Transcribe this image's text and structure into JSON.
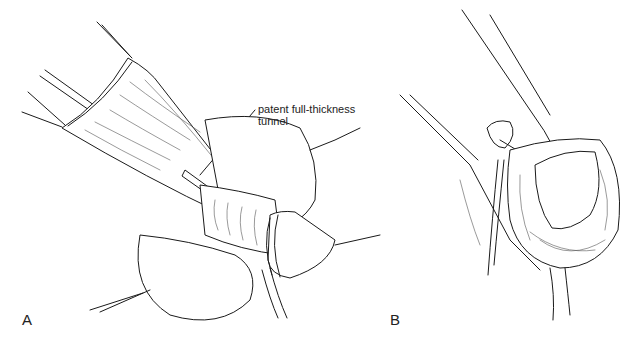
{
  "figure": {
    "panels": [
      {
        "id": "A",
        "label": "A",
        "callouts": [
          {
            "text_line1": "patent full-thickness",
            "text_line2": "tunnel"
          }
        ]
      },
      {
        "id": "B",
        "label": "B"
      }
    ],
    "colors": {
      "ink": "#1a1a1a",
      "background": "#ffffff"
    }
  }
}
